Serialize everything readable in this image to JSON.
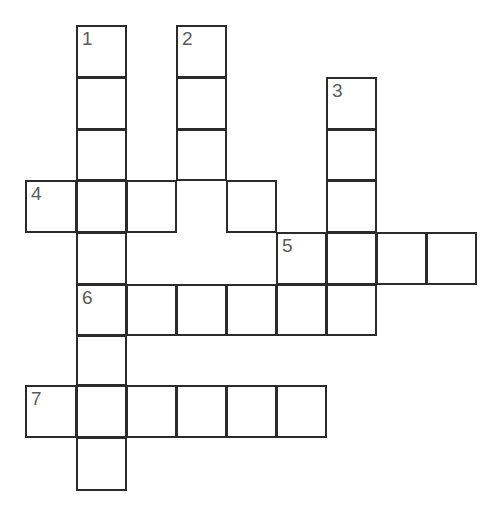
{
  "puzzle": {
    "type": "crossword-grid",
    "title": "Crossword puzzle grid",
    "cell_size": 50,
    "colors": {
      "background": "#ffffff",
      "cell_fill": "#ffffff",
      "cell_border": "#2b2b2b",
      "number_text": "#5a5a5a"
    },
    "columns_x": [
      25,
      76,
      126,
      176,
      226,
      276,
      326,
      376,
      426,
      476
    ],
    "rows_y": [
      25,
      77,
      129,
      180,
      232,
      284,
      335,
      385,
      437,
      490
    ],
    "numbers": [
      "1",
      "2",
      "3",
      "4",
      "5",
      "6",
      "7"
    ],
    "entries": [
      {
        "number": "1",
        "direction": "down",
        "start_col": 1,
        "start_row": 0,
        "length": 9,
        "label": "1"
      },
      {
        "number": "2",
        "direction": "down",
        "start_col": 3,
        "start_row": 0,
        "length": 4,
        "label": "2"
      },
      {
        "number": "3",
        "direction": "down",
        "start_col": 6,
        "start_row": 1,
        "length": 6,
        "label": "3"
      },
      {
        "number": "4",
        "direction": "across",
        "start_col": 0,
        "start_row": 3,
        "length": 5,
        "label": "4"
      },
      {
        "number": "5",
        "direction": "across",
        "start_col": 5,
        "start_row": 4,
        "length": 4,
        "label": "5"
      },
      {
        "number": "6",
        "direction": "across",
        "start_col": 1,
        "start_row": 5,
        "length": 6,
        "label": "6"
      },
      {
        "number": "7",
        "direction": "across",
        "start_col": 0,
        "start_row": 7,
        "length": 6,
        "label": "7"
      }
    ],
    "cells": [
      {
        "col": 1,
        "row": 0,
        "number": "1",
        "value": ""
      },
      {
        "col": 1,
        "row": 1,
        "number": "",
        "value": ""
      },
      {
        "col": 1,
        "row": 2,
        "number": "",
        "value": ""
      },
      {
        "col": 1,
        "row": 3,
        "number": "",
        "value": ""
      },
      {
        "col": 1,
        "row": 4,
        "number": "",
        "value": ""
      },
      {
        "col": 1,
        "row": 5,
        "number": "6",
        "value": ""
      },
      {
        "col": 1,
        "row": 6,
        "number": "",
        "value": ""
      },
      {
        "col": 1,
        "row": 7,
        "number": "",
        "value": ""
      },
      {
        "col": 1,
        "row": 8,
        "number": "",
        "value": ""
      },
      {
        "col": 3,
        "row": 0,
        "number": "2",
        "value": ""
      },
      {
        "col": 3,
        "row": 1,
        "number": "",
        "value": ""
      },
      {
        "col": 3,
        "row": 2,
        "number": "",
        "value": ""
      },
      {
        "col": 6,
        "row": 1,
        "number": "3",
        "value": ""
      },
      {
        "col": 6,
        "row": 2,
        "number": "",
        "value": ""
      },
      {
        "col": 6,
        "row": 3,
        "number": "",
        "value": ""
      },
      {
        "col": 6,
        "row": 4,
        "number": "",
        "value": ""
      },
      {
        "col": 0,
        "row": 3,
        "number": "4",
        "value": ""
      },
      {
        "col": 2,
        "row": 3,
        "number": "",
        "value": ""
      },
      {
        "col": 4,
        "row": 3,
        "number": "",
        "value": ""
      },
      {
        "col": 5,
        "row": 4,
        "number": "5",
        "value": ""
      },
      {
        "col": 7,
        "row": 4,
        "number": "",
        "value": ""
      },
      {
        "col": 8,
        "row": 4,
        "number": "",
        "value": ""
      },
      {
        "col": 2,
        "row": 5,
        "number": "",
        "value": ""
      },
      {
        "col": 3,
        "row": 5,
        "number": "",
        "value": ""
      },
      {
        "col": 4,
        "row": 5,
        "number": "",
        "value": ""
      },
      {
        "col": 5,
        "row": 5,
        "number": "",
        "value": ""
      },
      {
        "col": 6,
        "row": 5,
        "number": "",
        "value": ""
      },
      {
        "col": 0,
        "row": 7,
        "number": "7",
        "value": ""
      },
      {
        "col": 2,
        "row": 7,
        "number": "",
        "value": ""
      },
      {
        "col": 3,
        "row": 7,
        "number": "",
        "value": ""
      },
      {
        "col": 4,
        "row": 7,
        "number": "",
        "value": ""
      },
      {
        "col": 5,
        "row": 7,
        "number": "",
        "value": ""
      }
    ]
  }
}
